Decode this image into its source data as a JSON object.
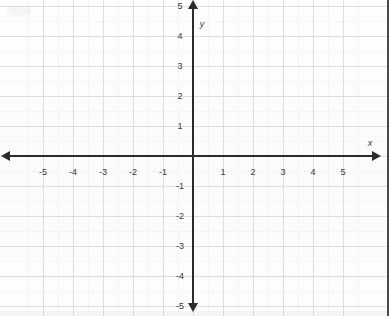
{
  "figure": {
    "type": "coordinate-plane",
    "title": "",
    "width": 389,
    "height": 316,
    "background_color": "#fdfdfd",
    "axis_color": "#2b2b2b",
    "grid_color": "#dcdee2",
    "grid_minor_color": "#ebedef",
    "label_color": "#3a3a3a"
  },
  "chart_data": {
    "type": "scatter",
    "title": "",
    "xlabel": "x",
    "ylabel": "y",
    "xlim": [
      -5.8,
      5.8
    ],
    "ylim": [
      -5.8,
      5.8
    ],
    "grid": true,
    "grid_major_step": 1,
    "grid_minor_step": 0.5,
    "legend": false,
    "series": [],
    "x": [],
    "y": [],
    "xticks": [
      -5,
      -4,
      -3,
      -2,
      -1,
      1,
      2,
      3,
      4,
      5
    ],
    "yticks": [
      -5,
      -4,
      -3,
      -2,
      -1,
      1,
      2,
      3,
      4,
      5
    ],
    "xtick_labels": [
      "-5",
      "-4",
      "-3",
      "-2",
      "-1",
      "1",
      "2",
      "3",
      "4",
      "5"
    ],
    "ytick_labels": [
      "-5",
      "-4",
      "-3",
      "-2",
      "-1",
      "1",
      "2",
      "3",
      "4",
      "5"
    ],
    "origin_label": "",
    "annotations": []
  },
  "axes": {
    "x_axis_name": "x",
    "y_axis_name": "y",
    "x_ticks": [
      {
        "value": -5,
        "label": "-5"
      },
      {
        "value": -4,
        "label": "-4"
      },
      {
        "value": -3,
        "label": "-3"
      },
      {
        "value": -2,
        "label": "-2"
      },
      {
        "value": -1,
        "label": "-1"
      },
      {
        "value": 1,
        "label": "1"
      },
      {
        "value": 2,
        "label": "2"
      },
      {
        "value": 3,
        "label": "3"
      },
      {
        "value": 4,
        "label": "4"
      },
      {
        "value": 5,
        "label": "5"
      }
    ],
    "y_ticks": [
      {
        "value": 5,
        "label": "5"
      },
      {
        "value": 4,
        "label": "4"
      },
      {
        "value": 3,
        "label": "3"
      },
      {
        "value": 2,
        "label": "2"
      },
      {
        "value": 1,
        "label": "1"
      },
      {
        "value": -1,
        "label": "-1"
      },
      {
        "value": -2,
        "label": "-2"
      },
      {
        "value": -3,
        "label": "-3"
      },
      {
        "value": -4,
        "label": "-4"
      },
      {
        "value": -5,
        "label": "-5"
      }
    ]
  },
  "geometry": {
    "origin_x": 193,
    "origin_y": 156,
    "unit_px": 30,
    "x_arrow_left_x": 10,
    "x_arrow_right_x": 372,
    "y_arrow_top_y": 9,
    "y_arrow_bottom_y": 303
  }
}
